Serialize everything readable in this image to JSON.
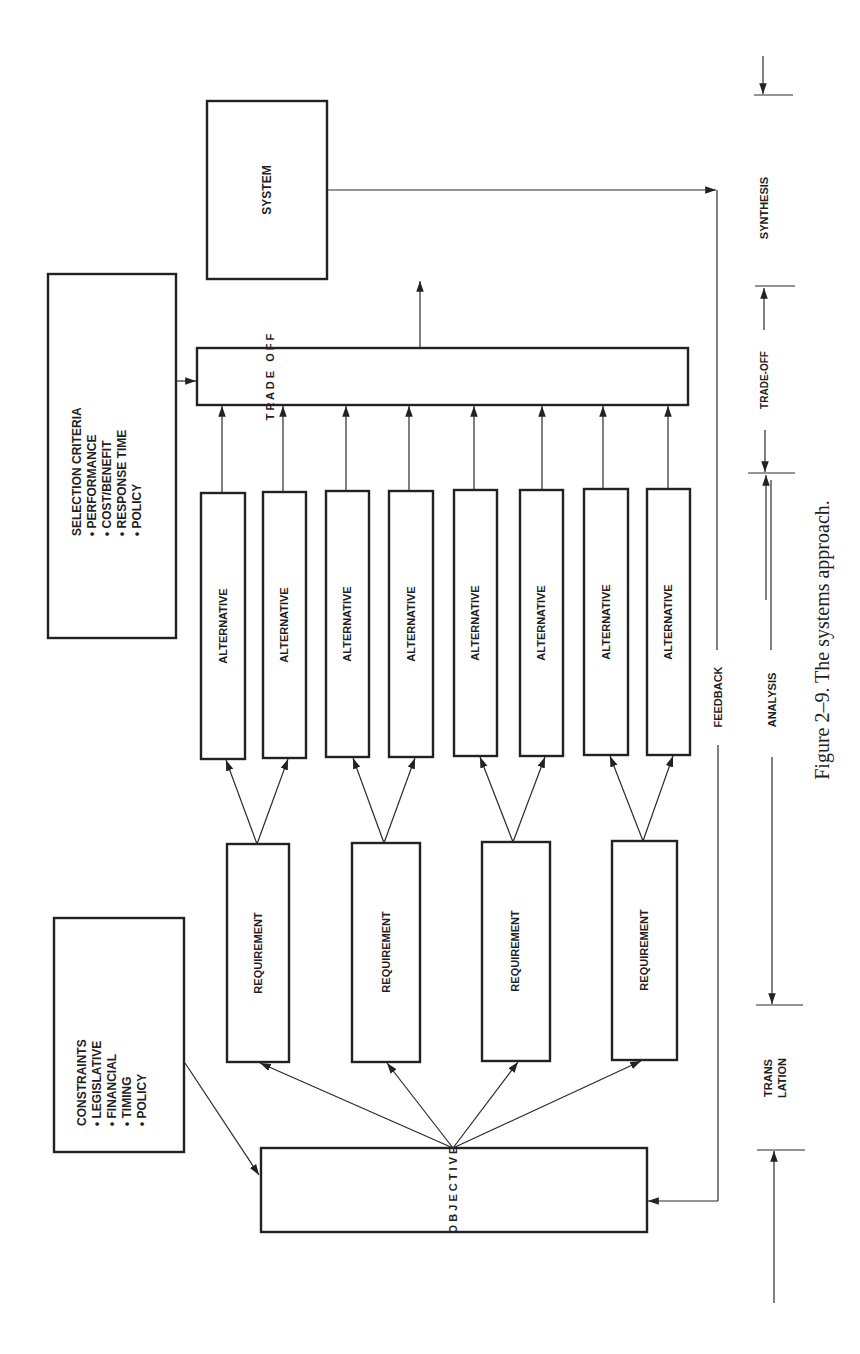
{
  "figure": {
    "caption": "Figure 2–9.  The systems approach.",
    "orientation": "rotated 90° counter-clockwise (landscape figure on portrait page)"
  },
  "nodes": {
    "system": "SYSTEM",
    "tradeoff": "T R A D E   O F F",
    "objective": "O B J E C T I V E",
    "alternatives": [
      "ALTERNATIVE",
      "ALTERNATIVE",
      "ALTERNATIVE",
      "ALTERNATIVE",
      "ALTERNATIVE",
      "ALTERNATIVE",
      "ALTERNATIVE",
      "ALTERNATIVE"
    ],
    "requirements": [
      "REQUIREMENT",
      "REQUIREMENT",
      "REQUIREMENT",
      "REQUIREMENT"
    ]
  },
  "selection_criteria": {
    "title": "SELECTION CRITERIA",
    "items": [
      "• PERFORMANCE",
      "• COST/BENEFIT",
      "• RESPONSE TIME",
      "• POLICY"
    ]
  },
  "constraints": {
    "title": "CONSTRAINTS",
    "items": [
      "• LEGISLATIVE",
      "• FINANCIAL",
      "• TIMING",
      "• POLICY"
    ]
  },
  "feedback_label": "FEEDBACK",
  "phases": {
    "synthesis": "SYNTHESIS",
    "tradeoff": "TRADE-OFF",
    "analysis": "ANALYSIS",
    "translation_line1": "TRANS",
    "translation_line2": "LATION"
  }
}
